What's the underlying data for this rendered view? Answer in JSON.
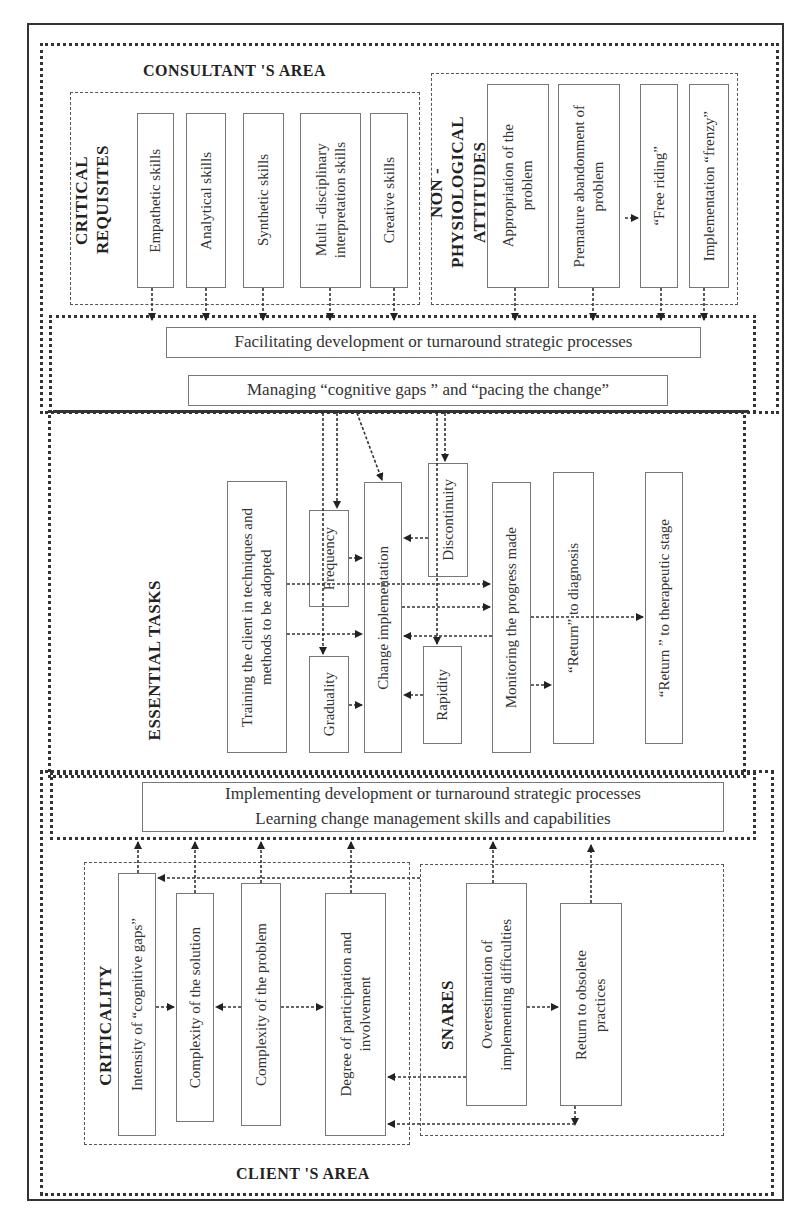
{
  "consultant_area": {
    "title": "CONSULTANT 'S AREA",
    "critical_requisites": {
      "title": "CRITICAL REQUISITES",
      "items": [
        "Empathetic skills",
        "Analytical skills",
        "Synthetic skills",
        "Multi -disciplinary\ninterpretation skills",
        "Creative skills"
      ]
    },
    "non_physiological_attitudes": {
      "title": "NON -PHYSIOLOGICAL\nATTITUDES",
      "items": [
        "Appropriation of the\nproblem",
        "Premature abandonment of\nproblem",
        "“Free riding”",
        "Implementation  “frenzy”"
      ]
    },
    "processes": [
      "Facilitating development or turnaround strategic processes",
      "Managing “cognitive gaps ” and “pacing the change”"
    ]
  },
  "essential_tasks": {
    "title": "ESSENTIAL TASKS",
    "training": "Training the client in techniques and\nmethods to be adopted",
    "frequency": "Frequency",
    "graduality": "Graduality",
    "change_implementation": "Change implementation",
    "discontinuity": "Discontinuity",
    "rapidity": "Rapidity",
    "monitoring": "Monitoring the progress made",
    "return_diagnosis": "“Return”   to diagnosis",
    "return_therapeutic": "“Return ” to therapeutic stage"
  },
  "client_area": {
    "title": "CLIENT 'S AREA",
    "processes": "Implementing  development or turnaround strategic processes\nLearning change management skills and capabilities",
    "criticality": {
      "title": "CRITICALITY",
      "items": [
        "Intensity of   “cognitive gaps”",
        "Complexity of the solution",
        "Complexity of the problem",
        "Degree of participation and\ninvolvement"
      ]
    },
    "snares": {
      "title": "SNARES",
      "items": [
        "Overestimation of\nimplementing difficulties",
        "Return to  obsolete\npractices"
      ]
    }
  },
  "colors": {
    "line": "#333333",
    "box_border": "#777777",
    "background": "#ffffff"
  }
}
